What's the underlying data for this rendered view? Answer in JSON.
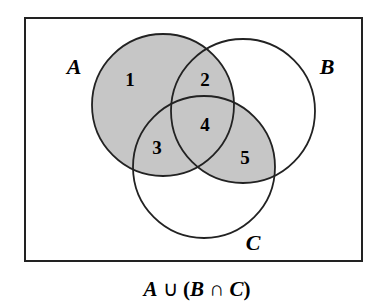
{
  "diagram": {
    "type": "venn",
    "universe": {
      "x": 25,
      "y": 18,
      "width": 337,
      "height": 243
    },
    "shade_color": "#c6c6c6",
    "stroke_color": "#222222",
    "sets": [
      {
        "name": "A",
        "label": "A",
        "cx": 163,
        "cy": 105,
        "r": 71,
        "label_x": 74,
        "label_y": 72
      },
      {
        "name": "B",
        "label": "B",
        "cx": 243,
        "cy": 111,
        "r": 72,
        "label_x": 326,
        "label_y": 73
      },
      {
        "name": "C",
        "label": "C",
        "cx": 204,
        "cy": 167,
        "r": 71,
        "label_x": 252,
        "label_y": 249
      }
    ],
    "regions": [
      {
        "label": "1",
        "x": 130,
        "y": 85
      },
      {
        "label": "2",
        "x": 205,
        "y": 85
      },
      {
        "label": "3",
        "x": 157,
        "y": 150
      },
      {
        "label": "4",
        "x": 205,
        "y": 130
      },
      {
        "label": "5",
        "x": 245,
        "y": 163
      }
    ],
    "shaded_regions": [
      "1",
      "2",
      "3",
      "4",
      "5"
    ],
    "caption": "A ∪ (B ∩ C)"
  }
}
